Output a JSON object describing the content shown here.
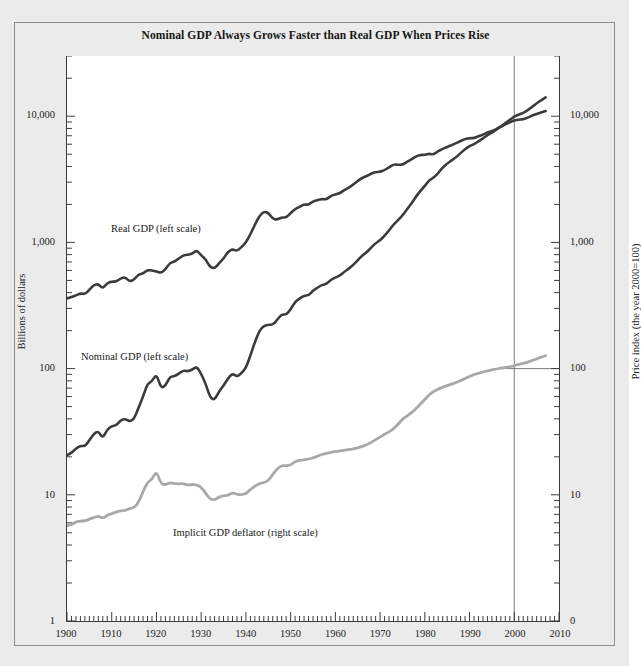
{
  "figure": {
    "title": "Nominal GDP Always Grows Faster than Real GDP When Prices Rise",
    "background": "#ebebeb",
    "plot_background": "#ffffff",
    "frame_color": "#8f8f8f"
  },
  "axes": {
    "left": {
      "title": "Billions of dollars",
      "ticks": [
        "10,000",
        "1,000",
        "100",
        "10",
        "1"
      ],
      "tick_values": [
        10000,
        1000,
        100,
        10,
        1
      ]
    },
    "right": {
      "title": "Price index (the year 2000=100)",
      "ticks": [
        "10,000",
        "1,000",
        "100",
        "10",
        "0"
      ],
      "tick_values": [
        10000,
        1000,
        100,
        10,
        1
      ]
    },
    "bottom": {
      "ticks": [
        "1900",
        "1910",
        "1920",
        "1930",
        "1940",
        "1950",
        "1960",
        "1970",
        "1980",
        "1990",
        "2000",
        "2010"
      ],
      "tick_values": [
        1900,
        1910,
        1920,
        1930,
        1940,
        1950,
        1960,
        1970,
        1980,
        1990,
        2000,
        2010
      ]
    }
  },
  "annotations": {
    "real_gdp": "Real GDP (left scale)",
    "nominal_gdp": "Nominal GDP (left scale)",
    "deflator": "Implicit GDP deflator (right scale)",
    "reference_year": "2000"
  },
  "chart_data": {
    "type": "line",
    "title": "Nominal GDP Always Grows Faster than Real GDP When Prices Rise",
    "xlabel": "",
    "ylabel": "Billions of dollars",
    "ylabel_right": "Price index (the year 2000=100)",
    "xlim": [
      1900,
      2010
    ],
    "ylim": [
      1,
      30000
    ],
    "yscale": "log",
    "ylim_right": [
      1,
      30000
    ],
    "grid": false,
    "legend": "inline-labels",
    "reference_lines": [
      {
        "type": "vertical",
        "x": 2000,
        "color": "#6e6e6e"
      },
      {
        "type": "horizontal",
        "y": 100,
        "x_from": 1996,
        "x_to": 2010,
        "color": "#6e6e6e"
      }
    ],
    "x": [
      1900,
      1901,
      1902,
      1903,
      1904,
      1905,
      1906,
      1907,
      1908,
      1909,
      1910,
      1911,
      1912,
      1913,
      1914,
      1915,
      1916,
      1917,
      1918,
      1919,
      1920,
      1921,
      1922,
      1923,
      1924,
      1925,
      1926,
      1927,
      1928,
      1929,
      1930,
      1931,
      1932,
      1933,
      1934,
      1935,
      1936,
      1937,
      1938,
      1939,
      1940,
      1941,
      1942,
      1943,
      1944,
      1945,
      1946,
      1947,
      1948,
      1949,
      1950,
      1951,
      1952,
      1953,
      1954,
      1955,
      1956,
      1957,
      1958,
      1959,
      1960,
      1961,
      1962,
      1963,
      1964,
      1965,
      1966,
      1967,
      1968,
      1969,
      1970,
      1971,
      1972,
      1973,
      1974,
      1975,
      1976,
      1977,
      1978,
      1979,
      1980,
      1981,
      1982,
      1983,
      1984,
      1985,
      1986,
      1987,
      1988,
      1989,
      1990,
      1991,
      1992,
      1993,
      1994,
      1995,
      1996,
      1997,
      1998,
      1999,
      2000,
      2001,
      2002,
      2003,
      2004,
      2005,
      2006,
      2007
    ],
    "series": [
      {
        "name": "Real GDP (left scale)",
        "axis": "left",
        "color": "#3b3b3b",
        "width": 2.6,
        "units": "billions of year-2000 dollars",
        "values": [
          360,
          368,
          380,
          395,
          388,
          420,
          460,
          468,
          430,
          478,
          490,
          488,
          520,
          530,
          490,
          505,
          560,
          565,
          605,
          600,
          588,
          572,
          610,
          690,
          705,
          745,
          790,
          800,
          812,
          868,
          790,
          735,
          635,
          622,
          685,
          745,
          845,
          885,
          852,
          918,
          995,
          1160,
          1380,
          1620,
          1750,
          1725,
          1530,
          1515,
          1580,
          1570,
          1710,
          1840,
          1915,
          2005,
          1980,
          2120,
          2165,
          2210,
          2190,
          2340,
          2400,
          2460,
          2600,
          2715,
          2875,
          3060,
          3260,
          3345,
          3505,
          3615,
          3620,
          3735,
          3935,
          4160,
          4135,
          4120,
          4345,
          4545,
          4800,
          4950,
          4930,
          5060,
          4950,
          5310,
          5500,
          5720,
          5910,
          6115,
          6370,
          6590,
          6710,
          6690,
          6930,
          7130,
          7430,
          7610,
          7890,
          8250,
          8610,
          8930,
          9300,
          9390,
          9470,
          9740,
          10110,
          10400,
          10700,
          11000
        ]
      },
      {
        "name": "Nominal GDP (left scale)",
        "axis": "left",
        "color": "#3b3b3b",
        "width": 2.6,
        "units": "billions of current dollars",
        "values": [
          20.6,
          21.5,
          23.2,
          24.5,
          24.2,
          27.0,
          30.5,
          32.0,
          28.0,
          33.0,
          35.0,
          35.5,
          39.0,
          40.0,
          38.0,
          40.0,
          49.0,
          60.0,
          76.0,
          79.0,
          91.0,
          70.0,
          73.0,
          86.0,
          87.0,
          91.0,
          97.0,
          95.0,
          98.0,
          104,
          91,
          76,
          58.7,
          56.4,
          66.0,
          73.3,
          83.8,
          91.9,
          86.1,
          92.2,
          101,
          127,
          162,
          199,
          219,
          223,
          222,
          244,
          270,
          267,
          294,
          339,
          358,
          379,
          380,
          415,
          438,
          461,
          467,
          507,
          527,
          545,
          586,
          618,
          664,
          720,
          788,
          833,
          910,
          985,
          1040,
          1130,
          1240,
          1385,
          1500,
          1635,
          1825,
          2030,
          2294,
          2563,
          2790,
          3128,
          3255,
          3537,
          3933,
          4220,
          4463,
          4740,
          5100,
          5484,
          5803,
          5996,
          6338,
          6667,
          7085,
          7415,
          7839,
          8332,
          8794,
          9354,
          9952,
          10286,
          10642,
          11142,
          11868,
          12638,
          13399,
          14078
        ]
      },
      {
        "name": "Implicit GDP deflator (right scale)",
        "axis": "right",
        "color": "#a8a8a8",
        "width": 2.8,
        "units": "index, 2000 = 100",
        "values": [
          5.7,
          5.8,
          6.1,
          6.2,
          6.2,
          6.4,
          6.6,
          6.8,
          6.5,
          6.9,
          7.1,
          7.3,
          7.5,
          7.5,
          7.8,
          7.9,
          8.7,
          10.6,
          12.6,
          13.2,
          15.5,
          12.2,
          12.0,
          12.5,
          12.3,
          12.2,
          12.3,
          11.9,
          12.1,
          12.0,
          11.5,
          10.3,
          9.2,
          9.1,
          9.6,
          9.8,
          9.9,
          10.4,
          10.1,
          10.0,
          10.2,
          11.0,
          11.7,
          12.3,
          12.5,
          12.9,
          14.5,
          16.1,
          17.1,
          17.0,
          17.2,
          18.4,
          18.7,
          18.9,
          19.2,
          19.6,
          20.2,
          20.9,
          21.3,
          21.7,
          22.0,
          22.2,
          22.5,
          22.8,
          23.1,
          23.5,
          24.2,
          24.9,
          26.0,
          27.3,
          28.7,
          30.2,
          31.5,
          33.3,
          36.3,
          39.7,
          42.0,
          44.7,
          48.0,
          52.2,
          57.0,
          62.2,
          66.1,
          68.8,
          71.3,
          73.5,
          75.3,
          77.6,
          80.3,
          83.3,
          86.5,
          89.7,
          91.8,
          93.9,
          95.8,
          97.6,
          99.4,
          101.0,
          101.9,
          103.1,
          105.6,
          108.0,
          109.9,
          112.4,
          115.8,
          119.5,
          123.2,
          126.4
        ]
      }
    ]
  }
}
